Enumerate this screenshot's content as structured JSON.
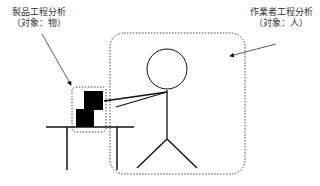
{
  "diagram": {
    "product_process_label": {
      "title": "製品工程分析",
      "subtitle": "（対象：物）"
    },
    "worker_process_label": {
      "title": "作業者工程分析",
      "subtitle": "（対象：人）"
    },
    "colors": {
      "line": "#111111",
      "text": "#333333",
      "dotted": "#444444",
      "background": "#ffffff"
    }
  }
}
